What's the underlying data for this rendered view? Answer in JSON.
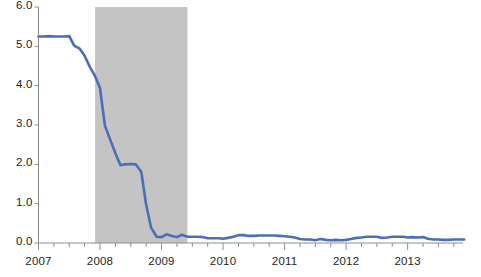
{
  "chart_data": {
    "type": "line",
    "title": "",
    "subtitle": "",
    "xlabel": "",
    "ylabel": "",
    "xlim": [
      2007.0,
      2013.9
    ],
    "ylim": [
      0.0,
      6.0
    ],
    "grid": false,
    "legend": null,
    "y_ticks": [
      "0.0",
      "1.0",
      "2.0",
      "3.0",
      "4.0",
      "5.0",
      "6.0"
    ],
    "y_tick_values": [
      0.0,
      1.0,
      2.0,
      3.0,
      4.0,
      5.0,
      6.0
    ],
    "x_ticks": [
      "2007",
      "2008",
      "2009",
      "2010",
      "2011",
      "2012",
      "2013"
    ],
    "x_tick_values": [
      2007,
      2008,
      2009,
      2010,
      2011,
      2012,
      2013
    ],
    "x_minor_tick_interval": 0.25,
    "line_color": "#4a6fb5",
    "line_width": 2.6,
    "shaded_regions": [
      {
        "name": "recession",
        "x_start": 2007.92,
        "x_end": 2009.42,
        "color": "#c4c4c4",
        "label": ""
      }
    ],
    "series": [
      {
        "name": "rate",
        "x": [
          2007.0,
          2007.08,
          2007.17,
          2007.25,
          2007.33,
          2007.42,
          2007.5,
          2007.58,
          2007.67,
          2007.75,
          2007.83,
          2007.92,
          2008.0,
          2008.08,
          2008.17,
          2008.25,
          2008.33,
          2008.42,
          2008.5,
          2008.58,
          2008.67,
          2008.75,
          2008.83,
          2008.92,
          2009.0,
          2009.08,
          2009.17,
          2009.25,
          2009.33,
          2009.42,
          2009.5,
          2009.58,
          2009.67,
          2009.75,
          2009.83,
          2009.92,
          2010.0,
          2010.08,
          2010.17,
          2010.25,
          2010.33,
          2010.42,
          2010.5,
          2010.58,
          2010.67,
          2010.75,
          2010.83,
          2010.92,
          2011.0,
          2011.08,
          2011.17,
          2011.25,
          2011.33,
          2011.42,
          2011.5,
          2011.58,
          2011.67,
          2011.75,
          2011.83,
          2011.92,
          2012.0,
          2012.08,
          2012.17,
          2012.25,
          2012.33,
          2012.42,
          2012.5,
          2012.58,
          2012.67,
          2012.75,
          2012.83,
          2012.92,
          2013.0,
          2013.08,
          2013.17,
          2013.25,
          2013.33,
          2013.42,
          2013.5,
          2013.58,
          2013.67,
          2013.75,
          2013.83,
          2013.92
        ],
        "values": [
          5.25,
          5.25,
          5.26,
          5.25,
          5.25,
          5.25,
          5.26,
          5.02,
          4.94,
          4.76,
          4.49,
          4.24,
          3.94,
          2.98,
          2.61,
          2.28,
          1.98,
          2.0,
          2.01,
          2.0,
          1.81,
          0.97,
          0.39,
          0.16,
          0.15,
          0.22,
          0.18,
          0.15,
          0.21,
          0.16,
          0.16,
          0.16,
          0.15,
          0.12,
          0.12,
          0.12,
          0.11,
          0.13,
          0.16,
          0.2,
          0.2,
          0.18,
          0.18,
          0.19,
          0.19,
          0.19,
          0.19,
          0.18,
          0.17,
          0.16,
          0.14,
          0.1,
          0.09,
          0.09,
          0.07,
          0.1,
          0.08,
          0.07,
          0.08,
          0.07,
          0.08,
          0.1,
          0.13,
          0.14,
          0.16,
          0.16,
          0.16,
          0.13,
          0.14,
          0.16,
          0.16,
          0.16,
          0.14,
          0.15,
          0.14,
          0.15,
          0.11,
          0.09,
          0.09,
          0.08,
          0.08,
          0.09,
          0.09,
          0.09
        ]
      }
    ]
  },
  "axes": {
    "axis_color": "#8e8e8e",
    "tick_color": "#8e8e8e",
    "label_color": "#231f20"
  }
}
